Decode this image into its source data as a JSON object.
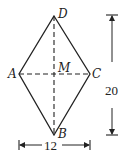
{
  "diagram": {
    "type": "rhombus-geometry",
    "vertices": {
      "D": {
        "label": "D",
        "x": 54,
        "y": 16
      },
      "A": {
        "label": "A",
        "x": 19,
        "y": 74
      },
      "C": {
        "label": "C",
        "x": 90,
        "y": 74
      },
      "B": {
        "label": "B",
        "x": 54,
        "y": 135
      },
      "M": {
        "label": "M",
        "x": 54,
        "y": 74
      }
    },
    "dimensions": {
      "vertical": {
        "label": "20"
      },
      "horizontal": {
        "label": "12"
      }
    },
    "colors": {
      "stroke": "#222222",
      "background": "#ffffff"
    }
  }
}
